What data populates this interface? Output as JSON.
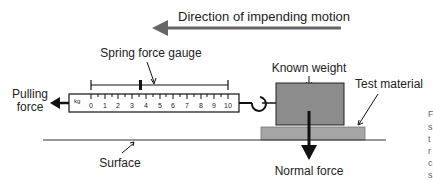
{
  "diagram": {
    "motion_label": "Direction of impending motion",
    "gauge_label": "Spring force gauge",
    "weight_label": "Known weight",
    "material_label": "Test material",
    "pulling_label_line1": "Pulling",
    "pulling_label_line2": "force",
    "surface_label": "Surface",
    "normal_label": "Normal force",
    "gauge_unit": "kg",
    "gauge_ticks": [
      "0",
      "1",
      "2",
      "3",
      "4",
      "5",
      "6",
      "7",
      "8",
      "9",
      "10"
    ],
    "gauge_reading": 3.6,
    "side_text": [
      "F",
      "s",
      "t",
      "r",
      "c",
      "s"
    ],
    "colors": {
      "arrow_gray": "#666666",
      "block_fill": "#8c8c8c",
      "material_fill": "#a6a6a6",
      "line": "#111111"
    }
  }
}
